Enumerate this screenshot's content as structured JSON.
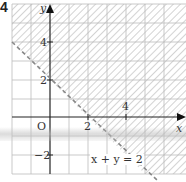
{
  "question_number": "4",
  "axes": {
    "x_label": "x",
    "y_label": "y",
    "origin_label": "O",
    "x_ticks": [
      {
        "value": 2,
        "label": "2"
      },
      {
        "value": 4,
        "label": "4"
      }
    ],
    "y_ticks": [
      {
        "value": 4,
        "label": "4"
      },
      {
        "value": 2,
        "label": "2"
      },
      {
        "value": -2,
        "label": "−2"
      }
    ]
  },
  "boundary": {
    "equation_label": "x + y = 2",
    "style": "dashed",
    "color": "#888888"
  },
  "region": {
    "description": "shaded region above line x + y = 2",
    "hatch_color": "#c8c8c8"
  },
  "grid": {
    "x_range": [
      -2,
      7
    ],
    "y_range": [
      -3,
      6
    ],
    "line_color": "#bbbbbb"
  }
}
